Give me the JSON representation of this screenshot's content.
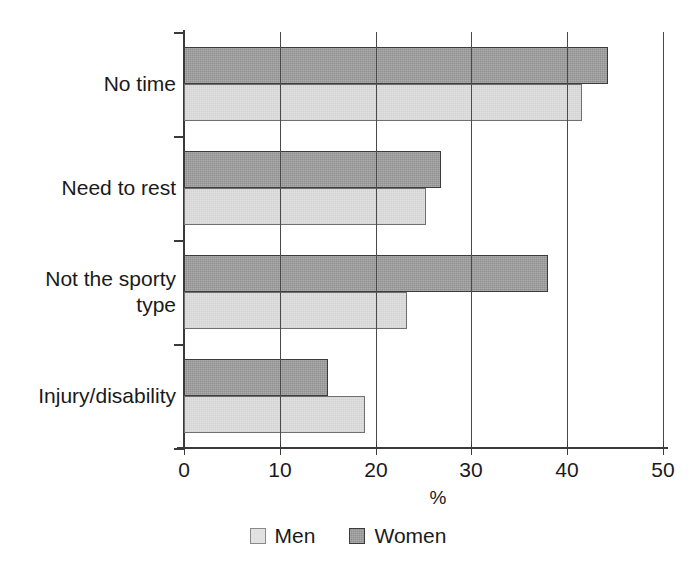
{
  "chart_data": {
    "type": "bar",
    "orientation": "horizontal",
    "title": "",
    "xlabel": "%",
    "ylabel": "",
    "xlim": [
      0,
      50
    ],
    "xticks": [
      0,
      10,
      20,
      30,
      40,
      50
    ],
    "xtick_labels": [
      "0",
      "10",
      "20",
      "30",
      "40",
      "50"
    ],
    "grid": "vertical",
    "legend_position": "bottom-center",
    "categories": [
      "No time",
      "Need to rest",
      "Not the sporty\ntype",
      "Injury/disability"
    ],
    "series": [
      {
        "name": "Men",
        "color": "#e1e1e1",
        "values": [
          41.5,
          25.3,
          23.3,
          18.9
        ]
      },
      {
        "name": "Women",
        "color": "#909090",
        "values": [
          44.3,
          26.8,
          38.0,
          15.0
        ]
      }
    ]
  },
  "legend": {
    "items": [
      {
        "label": "Men"
      },
      {
        "label": "Women"
      }
    ]
  },
  "axis": {
    "x_title": "%"
  }
}
